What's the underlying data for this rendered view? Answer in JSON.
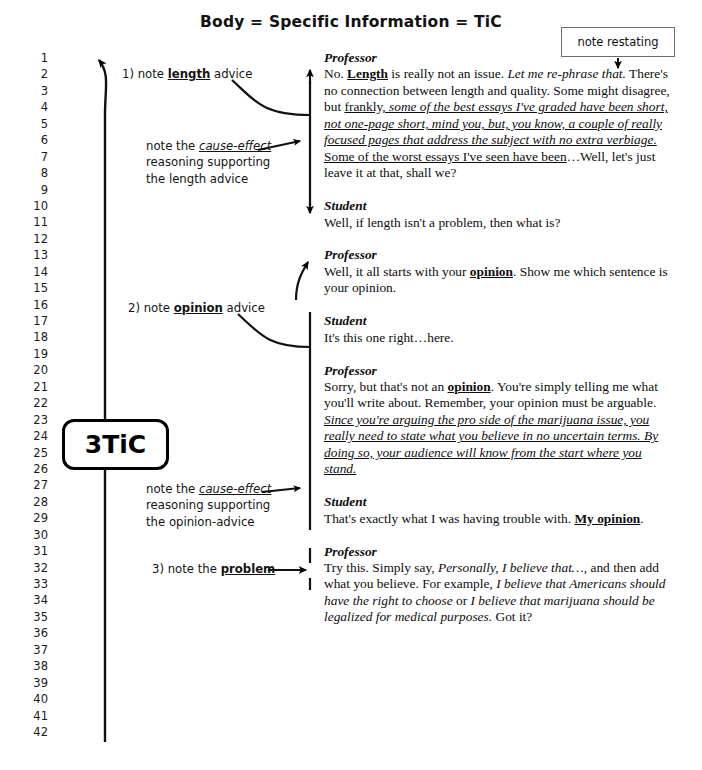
{
  "title": "Body = Specific Information = TiC",
  "callout": {
    "note_restating": "note restating"
  },
  "badge": {
    "label": "3TiC"
  },
  "line_numbers": [
    "1",
    "2",
    "3",
    "4",
    "5",
    "6",
    "7",
    "8",
    "9",
    "10",
    "11",
    "12",
    "13",
    "14",
    "15",
    "16",
    "17",
    "18",
    "19",
    "20",
    "21",
    "22",
    "23",
    "24",
    "25",
    "26",
    "27",
    "28",
    "29",
    "30",
    "31",
    "32",
    "33",
    "34",
    "35",
    "36",
    "37",
    "38",
    "39",
    "40",
    "41",
    "42"
  ],
  "annotations": {
    "length_advice": {
      "prefix": "1) note ",
      "keyword": "length",
      "suffix": " advice"
    },
    "cause_effect_length": {
      "line1_prefix": "note the ",
      "line1_keyword": "cause-effect",
      "line2": "reasoning supporting",
      "line3": "the length advice"
    },
    "opinion_advice": {
      "prefix": "2) note ",
      "keyword": "opinion",
      "suffix": " advice"
    },
    "cause_effect_opinion": {
      "line1_prefix": "note the ",
      "line1_keyword": "cause-effect",
      "line2": "reasoning supporting",
      "line3": "the opinion-advice"
    },
    "problem": {
      "prefix": "3) note the ",
      "keyword": "problem",
      "suffix": ""
    }
  },
  "dialogue": [
    {
      "speaker": "Professor",
      "segments": [
        {
          "text": "No. ",
          "style": "plain"
        },
        {
          "text": "Length",
          "style": "bold-underline"
        },
        {
          "text": " is really not an issue. ",
          "style": "plain"
        },
        {
          "text": "Let me re-phrase that.",
          "style": "italic"
        },
        {
          "text": " There's no connection between length and quality. Some might disagree, but ",
          "style": "plain"
        },
        {
          "text": "frankly, ",
          "style": "underline"
        },
        {
          "text": "some of the best essays I've graded have been short, not one-page short, mind you, but, you know, a couple of really focused pages that address the subject with no extra verbiage.",
          "style": "italic-underline"
        },
        {
          "text": " Some of the worst essays I've seen have been",
          "style": "underline"
        },
        {
          "text": "…Well, let's just leave it at that, shall we?",
          "style": "plain"
        }
      ]
    },
    {
      "speaker": "Student",
      "segments": [
        {
          "text": "Well, if length isn't a problem, then what is?",
          "style": "plain"
        }
      ]
    },
    {
      "speaker": "Professor",
      "segments": [
        {
          "text": "Well, it all starts with your ",
          "style": "plain"
        },
        {
          "text": "opinion",
          "style": "bold-underline"
        },
        {
          "text": ". Show me which sentence is your opinion.",
          "style": "plain"
        }
      ]
    },
    {
      "speaker": "Student",
      "segments": [
        {
          "text": "It's this one right…here.",
          "style": "plain"
        }
      ]
    },
    {
      "speaker": "Professor",
      "segments": [
        {
          "text": "Sorry, but that's not an ",
          "style": "plain"
        },
        {
          "text": "opinion",
          "style": "bold-underline"
        },
        {
          "text": ". You're simply telling me what you'll write about. Remember, your opinion must be arguable. ",
          "style": "plain"
        },
        {
          "text": "Since you're arguing the pro side of the marijuana issue, you really need to state what you believe in no uncertain terms. By doing so, your audience will know from the start where you stand.",
          "style": "italic-underline"
        }
      ]
    },
    {
      "speaker": "Student",
      "segments": [
        {
          "text": "That's exactly what I was having trouble with. ",
          "style": "plain"
        },
        {
          "text": "My opinion",
          "style": "bold-underline"
        },
        {
          "text": ".",
          "style": "plain"
        }
      ]
    },
    {
      "speaker": "Professor",
      "segments": [
        {
          "text": "Try this. Simply say, ",
          "style": "plain"
        },
        {
          "text": "Personally, I believe that…,",
          "style": "italic"
        },
        {
          "text": " and then add what you believe. For example, ",
          "style": "plain"
        },
        {
          "text": "I believe that Americans should have the right to choose",
          "style": "italic"
        },
        {
          "text": " or ",
          "style": "plain"
        },
        {
          "text": "I believe that marijuana should be legalized for medical purposes.",
          "style": "italic"
        },
        {
          "text": " Got it?",
          "style": "plain"
        }
      ]
    }
  ],
  "colors": {
    "ink": "#000000",
    "box_border": "#6d6d6d",
    "page_bg": "#ffffff"
  }
}
